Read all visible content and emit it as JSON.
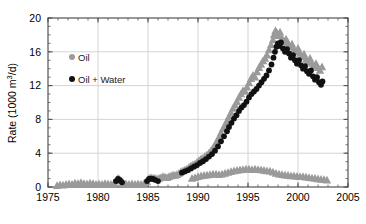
{
  "chart_data": {
    "type": "scatter",
    "title": "",
    "xlabel": "",
    "ylabel": "Rate (1000 m",
    "ylabel_sup": "3",
    "ylabel_tail": "/d)",
    "ylabel_full": "Rate (1000 m3/d)",
    "xlim": [
      1975,
      2005
    ],
    "ylim": [
      0,
      20
    ],
    "xticks": [
      1975,
      1980,
      1985,
      1990,
      1995,
      2000,
      2005
    ],
    "yticks": [
      0,
      4,
      8,
      12,
      16,
      20
    ],
    "xtick_labels": [
      "1975",
      "1980",
      "1985",
      "1990",
      "1995",
      "2000",
      "2005"
    ],
    "ytick_labels": [
      "0",
      "4",
      "8",
      "12",
      "16",
      "20"
    ],
    "xminor_step": 1,
    "yminor_step": 1,
    "grid": true,
    "grid_color": "#cfcfcf",
    "axis_color": "#555555",
    "legend_position": "upper-left-inside",
    "legend": [
      {
        "name": "Oil",
        "color": "#9a9a9a",
        "marker": "circle"
      },
      {
        "name": "Oil + Water",
        "color": "#111111",
        "marker": "circle"
      }
    ],
    "series": [
      {
        "name": "Oil",
        "color": "#9a9a9a",
        "marker": "triangle",
        "marker_size": 3.1,
        "points": [
          [
            1975.9,
            0.15
          ],
          [
            1976.2,
            0.25
          ],
          [
            1976.5,
            0.2
          ],
          [
            1976.8,
            0.3
          ],
          [
            1977.1,
            0.35
          ],
          [
            1977.4,
            0.3
          ],
          [
            1977.7,
            0.45
          ],
          [
            1978.0,
            0.4
          ],
          [
            1978.3,
            0.5
          ],
          [
            1978.6,
            0.4
          ],
          [
            1978.9,
            0.35
          ],
          [
            1979.2,
            0.45
          ],
          [
            1979.5,
            0.4
          ],
          [
            1979.8,
            0.3
          ],
          [
            1980.1,
            0.35
          ],
          [
            1980.4,
            0.3
          ],
          [
            1980.7,
            0.4
          ],
          [
            1981.0,
            0.35
          ],
          [
            1981.3,
            0.3
          ],
          [
            1981.6,
            0.45
          ],
          [
            1981.9,
            0.8
          ],
          [
            1982.0,
            1.0
          ],
          [
            1982.15,
            0.9
          ],
          [
            1982.3,
            0.7
          ],
          [
            1982.5,
            0.5
          ],
          [
            1982.8,
            0.35
          ],
          [
            1983.1,
            0.3
          ],
          [
            1983.4,
            0.35
          ],
          [
            1983.7,
            0.3
          ],
          [
            1984.0,
            0.35
          ],
          [
            1984.3,
            0.3
          ],
          [
            1984.6,
            0.4
          ],
          [
            1984.9,
            0.6
          ],
          [
            1985.1,
            1.0
          ],
          [
            1985.3,
            1.1
          ],
          [
            1985.5,
            1.05
          ],
          [
            1985.7,
            1.0
          ],
          [
            1985.9,
            0.95
          ],
          [
            1986.1,
            1.0
          ],
          [
            1986.3,
            1.1
          ],
          [
            1986.5,
            1.2
          ],
          [
            1986.7,
            1.15
          ],
          [
            1986.9,
            1.1
          ],
          [
            1987.1,
            1.2
          ],
          [
            1987.3,
            1.3
          ],
          [
            1987.5,
            1.4
          ],
          [
            1987.7,
            1.35
          ],
          [
            1987.9,
            1.45
          ],
          [
            1988.1,
            1.6
          ],
          [
            1988.3,
            1.8
          ],
          [
            1988.5,
            1.9
          ],
          [
            1988.7,
            2.0
          ],
          [
            1988.9,
            2.1
          ],
          [
            1989.1,
            2.3
          ],
          [
            1989.3,
            2.5
          ],
          [
            1989.5,
            2.6
          ],
          [
            1989.7,
            2.7
          ],
          [
            1989.9,
            2.9
          ],
          [
            1990.1,
            3.1
          ],
          [
            1990.3,
            3.3
          ],
          [
            1990.5,
            3.4
          ],
          [
            1990.7,
            3.6
          ],
          [
            1990.9,
            3.8
          ],
          [
            1991.1,
            4.0
          ],
          [
            1991.3,
            4.3
          ],
          [
            1991.5,
            4.6
          ],
          [
            1991.7,
            5.0
          ],
          [
            1991.9,
            5.4
          ],
          [
            1992.1,
            5.9
          ],
          [
            1992.3,
            6.4
          ],
          [
            1992.5,
            6.9
          ],
          [
            1992.7,
            7.3
          ],
          [
            1992.9,
            7.8
          ],
          [
            1993.1,
            8.3
          ],
          [
            1993.3,
            8.8
          ],
          [
            1993.5,
            9.3
          ],
          [
            1993.7,
            9.7
          ],
          [
            1993.9,
            10.1
          ],
          [
            1994.1,
            10.6
          ],
          [
            1994.3,
            11.0
          ],
          [
            1994.5,
            11.4
          ],
          [
            1994.7,
            11.3
          ],
          [
            1994.9,
            11.8
          ],
          [
            1995.1,
            12.3
          ],
          [
            1995.3,
            12.8
          ],
          [
            1995.5,
            13.2
          ],
          [
            1995.7,
            13.0
          ],
          [
            1995.9,
            13.6
          ],
          [
            1996.1,
            14.1
          ],
          [
            1996.3,
            14.5
          ],
          [
            1996.5,
            14.9
          ],
          [
            1996.7,
            15.2
          ],
          [
            1996.9,
            15.6
          ],
          [
            1997.1,
            16.2
          ],
          [
            1997.3,
            16.8
          ],
          [
            1997.5,
            17.4
          ],
          [
            1997.6,
            18.0
          ],
          [
            1997.75,
            18.5
          ],
          [
            1997.9,
            18.2
          ],
          [
            1998.05,
            17.9
          ],
          [
            1998.2,
            18.3
          ],
          [
            1998.4,
            17.6
          ],
          [
            1998.6,
            17.2
          ],
          [
            1998.8,
            17.5
          ],
          [
            1999.0,
            17.0
          ],
          [
            1999.2,
            16.6
          ],
          [
            1999.4,
            16.9
          ],
          [
            1999.6,
            16.3
          ],
          [
            1999.8,
            16.0
          ],
          [
            2000.0,
            16.4
          ],
          [
            2000.2,
            15.8
          ],
          [
            2000.4,
            15.4
          ],
          [
            2000.6,
            15.7
          ],
          [
            2000.8,
            15.1
          ],
          [
            2001.0,
            14.8
          ],
          [
            2001.2,
            15.2
          ],
          [
            2001.4,
            14.6
          ],
          [
            2001.6,
            14.3
          ],
          [
            2001.8,
            14.6
          ],
          [
            2002.0,
            14.1
          ],
          [
            2002.2,
            13.8
          ],
          [
            2002.4,
            14.2
          ]
        ]
      },
      {
        "name": "Oil-low-band",
        "color": "#9a9a9a",
        "marker": "triangle",
        "marker_size": 3.1,
        "points": [
          [
            1989.4,
            1.0
          ],
          [
            1989.7,
            1.1
          ],
          [
            1990.0,
            1.2
          ],
          [
            1990.3,
            1.3
          ],
          [
            1990.6,
            1.35
          ],
          [
            1990.9,
            1.4
          ],
          [
            1991.2,
            1.45
          ],
          [
            1991.5,
            1.5
          ],
          [
            1991.8,
            1.5
          ],
          [
            1992.1,
            1.45
          ],
          [
            1992.4,
            1.5
          ],
          [
            1992.7,
            1.6
          ],
          [
            1993.0,
            1.7
          ],
          [
            1993.3,
            1.8
          ],
          [
            1993.6,
            1.9
          ],
          [
            1993.9,
            1.95
          ],
          [
            1994.2,
            2.0
          ],
          [
            1994.5,
            2.05
          ],
          [
            1994.8,
            2.1
          ],
          [
            1995.1,
            2.1
          ],
          [
            1995.4,
            2.05
          ],
          [
            1995.7,
            2.1
          ],
          [
            1996.0,
            2.05
          ],
          [
            1996.3,
            2.0
          ],
          [
            1996.6,
            1.95
          ],
          [
            1996.9,
            1.9
          ],
          [
            1997.2,
            1.85
          ],
          [
            1997.5,
            1.75
          ],
          [
            1997.8,
            1.6
          ],
          [
            1998.1,
            1.5
          ],
          [
            1998.4,
            1.45
          ],
          [
            1998.7,
            1.4
          ],
          [
            1999.0,
            1.35
          ],
          [
            1999.3,
            1.3
          ],
          [
            1999.6,
            1.3
          ],
          [
            1999.9,
            1.25
          ],
          [
            2000.2,
            1.2
          ],
          [
            2000.5,
            1.2
          ],
          [
            2000.8,
            1.15
          ],
          [
            2001.1,
            1.1
          ],
          [
            2001.4,
            1.05
          ],
          [
            2001.7,
            1.0
          ],
          [
            2002.0,
            0.95
          ],
          [
            2002.3,
            0.9
          ],
          [
            2002.6,
            0.85
          ],
          [
            2002.9,
            0.8
          ]
        ]
      },
      {
        "name": "Oil + Water",
        "color": "#111111",
        "marker": "circle",
        "marker_size": 2.9,
        "points": [
          [
            1981.8,
            0.7
          ],
          [
            1982.0,
            0.95
          ],
          [
            1982.2,
            0.8
          ],
          [
            1982.4,
            0.55
          ],
          [
            1984.9,
            0.7
          ],
          [
            1985.1,
            0.95
          ],
          [
            1985.3,
            1.0
          ],
          [
            1985.5,
            0.95
          ],
          [
            1985.7,
            0.85
          ],
          [
            1986.0,
            0.7
          ],
          [
            1988.4,
            1.7
          ],
          [
            1988.7,
            1.85
          ],
          [
            1989.0,
            2.0
          ],
          [
            1989.3,
            2.2
          ],
          [
            1989.6,
            2.4
          ],
          [
            1989.9,
            2.6
          ],
          [
            1990.2,
            2.85
          ],
          [
            1990.5,
            3.05
          ],
          [
            1990.8,
            3.3
          ],
          [
            1991.1,
            3.6
          ],
          [
            1991.4,
            3.9
          ],
          [
            1991.7,
            4.3
          ],
          [
            1992.0,
            4.8
          ],
          [
            1992.3,
            5.4
          ],
          [
            1992.6,
            6.0
          ],
          [
            1992.9,
            6.6
          ],
          [
            1993.1,
            7.1
          ],
          [
            1993.35,
            7.6
          ],
          [
            1993.6,
            8.1
          ],
          [
            1993.85,
            8.5
          ],
          [
            1994.1,
            9.0
          ],
          [
            1994.35,
            9.4
          ],
          [
            1994.6,
            9.7
          ],
          [
            1994.85,
            10.1
          ],
          [
            1995.1,
            10.6
          ],
          [
            1995.35,
            11.0
          ],
          [
            1995.6,
            11.3
          ],
          [
            1995.85,
            11.6
          ],
          [
            1996.1,
            12.0
          ],
          [
            1996.35,
            12.4
          ],
          [
            1996.6,
            12.8
          ],
          [
            1996.85,
            13.2
          ],
          [
            1997.1,
            13.8
          ],
          [
            1997.35,
            14.5
          ],
          [
            1997.55,
            15.3
          ],
          [
            1997.7,
            16.0
          ],
          [
            1997.85,
            16.6
          ],
          [
            1998.0,
            17.0
          ],
          [
            1998.15,
            16.7
          ],
          [
            1998.3,
            17.1
          ],
          [
            1998.5,
            16.4
          ],
          [
            1998.7,
            16.0
          ],
          [
            1998.9,
            16.3
          ],
          [
            1999.1,
            15.8
          ],
          [
            1999.3,
            15.3
          ],
          [
            1999.5,
            15.6
          ],
          [
            1999.7,
            15.0
          ],
          [
            1999.9,
            14.6
          ],
          [
            2000.1,
            15.0
          ],
          [
            2000.3,
            14.4
          ],
          [
            2000.5,
            14.0
          ],
          [
            2000.7,
            14.3
          ],
          [
            2000.9,
            13.7
          ],
          [
            2001.1,
            13.4
          ],
          [
            2001.3,
            13.8
          ],
          [
            2001.5,
            13.1
          ],
          [
            2001.7,
            12.7
          ],
          [
            2001.9,
            13.0
          ],
          [
            2002.1,
            12.4
          ],
          [
            2002.3,
            12.1
          ],
          [
            2002.45,
            12.5
          ]
        ]
      }
    ]
  }
}
